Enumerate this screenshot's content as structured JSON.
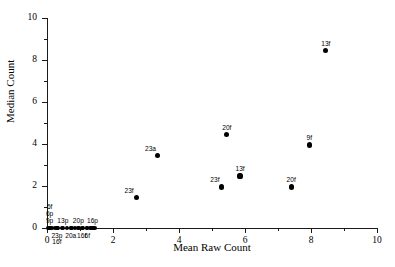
{
  "chart_data": {
    "type": "scatter",
    "title": "",
    "xlabel": "Mean Raw Count",
    "ylabel": "Median Count",
    "xlim": [
      0,
      10
    ],
    "ylim": [
      0,
      10
    ],
    "xticks": [
      0,
      2,
      4,
      6,
      8,
      10
    ],
    "xtick_labels": [
      "0",
      "2",
      "4",
      "6",
      "8",
      "10"
    ],
    "xminor_ticks": [
      1,
      3,
      5,
      7,
      9
    ],
    "yticks": [
      0,
      2,
      4,
      6,
      8,
      10
    ],
    "ytick_labels": [
      "0",
      "2",
      "4",
      "6",
      "8",
      "10"
    ],
    "yminor_ticks": [
      1,
      3,
      5,
      7,
      9
    ],
    "grid": false,
    "legend": "none",
    "points": [
      {
        "label": "13f",
        "x": 8.45,
        "y": 8.45,
        "label_pos": "above"
      },
      {
        "label": "20f",
        "x": 5.45,
        "y": 4.45,
        "label_pos": "above"
      },
      {
        "label": "9f",
        "x": 7.95,
        "y": 3.95,
        "label_pos": "above"
      },
      {
        "label": "23a",
        "x": 3.35,
        "y": 3.45,
        "label_pos": "above-left"
      },
      {
        "label": "13f",
        "x": 5.85,
        "y": 2.48,
        "label_pos": "above"
      },
      {
        "label": "23f",
        "x": 5.3,
        "y": 1.95,
        "label_pos": "above-left"
      },
      {
        "label": "20f",
        "x": 7.4,
        "y": 1.95,
        "label_pos": "above"
      },
      {
        "label": "23f",
        "x": 2.7,
        "y": 1.45,
        "label_pos": "above-left"
      },
      {
        "label": "9p",
        "x": 0.08,
        "y": 0,
        "label_pos": "above"
      },
      {
        "label": "6p",
        "x": 0.08,
        "y": 0,
        "label_pos": "above-2"
      },
      {
        "label": "6f",
        "x": 0.08,
        "y": 0,
        "label_pos": "above-3"
      },
      {
        "label": "23p",
        "x": 0.3,
        "y": 0,
        "label_pos": "below"
      },
      {
        "label": "16f",
        "x": 0.3,
        "y": 0,
        "label_pos": "below-2"
      },
      {
        "label": "13p",
        "x": 0.48,
        "y": 0,
        "label_pos": "above"
      },
      {
        "label": "20a",
        "x": 0.72,
        "y": 0,
        "label_pos": "below"
      },
      {
        "label": "20p",
        "x": 0.95,
        "y": 0,
        "label_pos": "above"
      },
      {
        "label": "16f",
        "x": 1.05,
        "y": 0,
        "label_pos": "below"
      },
      {
        "label": "6f",
        "x": 1.22,
        "y": 0,
        "label_pos": "below"
      },
      {
        "label": "16p",
        "x": 1.38,
        "y": 0,
        "label_pos": "above"
      }
    ],
    "zero_row_markers_x": [
      0.04,
      0.14,
      0.24,
      0.34,
      0.46,
      0.6,
      0.74,
      0.86,
      0.98,
      1.08,
      1.2,
      1.32,
      1.44
    ]
  }
}
